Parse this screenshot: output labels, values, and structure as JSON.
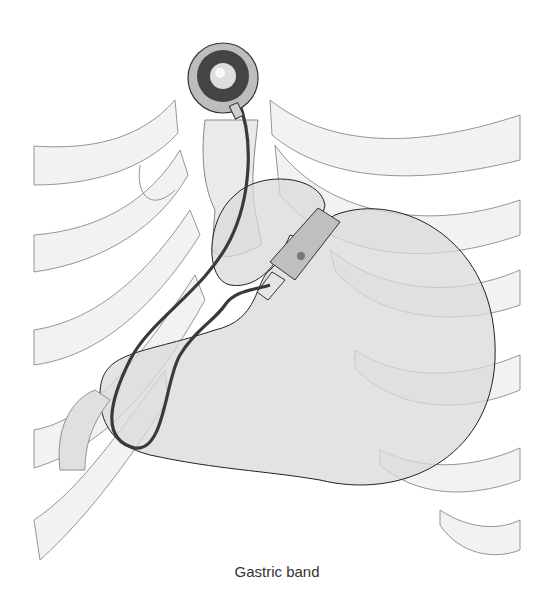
{
  "figure": {
    "caption": "Gastric band",
    "components": [
      {
        "name": "access-port",
        "label": "Access port"
      },
      {
        "name": "tubing",
        "label": "Connecting tube"
      },
      {
        "name": "adjustable-band",
        "label": "Adjustable band"
      },
      {
        "name": "stomach",
        "label": "Stomach"
      },
      {
        "name": "esophagus",
        "label": "Oesophagus"
      },
      {
        "name": "ribcage",
        "label": "Rib cage"
      }
    ],
    "colors": {
      "background": "#ffffff",
      "rib_fill": "#f2f2f2",
      "outline": "#8a8a8a",
      "stomach_fill": "#d9d9d9",
      "port_dark": "#4a4a4a",
      "band_fill": "#bfbfbf"
    }
  }
}
